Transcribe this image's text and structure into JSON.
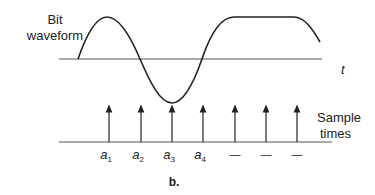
{
  "diagram": {
    "type": "signal-sampling",
    "waveform_label_line1": "Bit",
    "waveform_label_line2": "waveform",
    "time_axis_label": "t",
    "sample_label_line1": "Sample",
    "sample_label_line2": "times",
    "caption": "b.",
    "sample_points": [
      {
        "base": "a",
        "sub": "1"
      },
      {
        "base": "a",
        "sub": "2"
      },
      {
        "base": "a",
        "sub": "3"
      },
      {
        "base": "a",
        "sub": "4"
      },
      {
        "base": "—",
        "sub": ""
      },
      {
        "base": "—",
        "sub": ""
      },
      {
        "base": "—",
        "sub": ""
      }
    ],
    "colors": {
      "line": "#222222",
      "axis": "#555555",
      "background": "#ffffff"
    }
  }
}
